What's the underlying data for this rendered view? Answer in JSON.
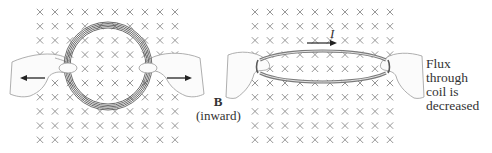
{
  "figure": {
    "left_panel": {
      "description": "circular coil in inward magnetic field, pulled outward by hands",
      "grid": {
        "cols": 10,
        "rows": 10,
        "x0": 40,
        "y0": 12,
        "dx": 15,
        "dy": 14.2
      },
      "coil": {
        "cx": 108,
        "cy": 66,
        "r": 42
      },
      "arrows": [
        "left",
        "right"
      ]
    },
    "right_panel": {
      "description": "coil stretched into flattened ellipse, reducing flux",
      "grid": {
        "cols": 10,
        "rows": 10,
        "x0": 255,
        "y0": 12,
        "dx": 15,
        "dy": 14.2
      },
      "coil": {
        "cx": 322,
        "cy": 66,
        "rx": 64,
        "ry": 14
      },
      "current_label": "I"
    },
    "field_label": {
      "symbol": "B",
      "direction": "(inward)"
    },
    "flux_caption": {
      "lines": [
        "Flux",
        "through",
        "coil is",
        "decreased"
      ]
    },
    "colors": {
      "cross": "#8a8a8a",
      "coil": "#5a5a5a",
      "hand": "#9a9a9a",
      "arrow": "#222222",
      "text": "#333333"
    }
  }
}
